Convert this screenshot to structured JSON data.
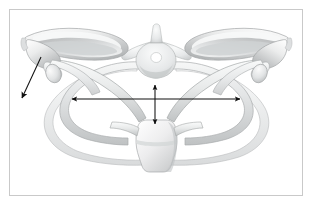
{
  "figure": {
    "domain": "anatomical-illustration",
    "description": "Grayscale medical illustration showing a thoracic vertebra at center, paired ribs forming the thoracic cage, the clavicles, the sternum at the bottom, and the two scapulae at upper left and upper right. Three black measurement arrows are overlaid.",
    "background_color": "#ffffff",
    "frame_border_color": "#c9c9c9",
    "bone_fill_light": "#f4f4f4",
    "bone_fill_mid": "#dedede",
    "bone_fill_dark": "#b4b4b4",
    "bone_outline": "#9a9a9a",
    "annotation_color": "#101010"
  },
  "structures": [
    {
      "id": "left-scapula",
      "name": "Left scapula",
      "label": ""
    },
    {
      "id": "right-scapula",
      "name": "Right scapula",
      "label": ""
    },
    {
      "id": "thoracic-vertebra",
      "name": "Thoracic vertebra",
      "label": ""
    },
    {
      "id": "vertebral-foramen",
      "name": "Vertebral foramen",
      "label": ""
    },
    {
      "id": "left-clavicle",
      "name": "Left clavicle",
      "label": ""
    },
    {
      "id": "right-clavicle",
      "name": "Right clavicle",
      "label": ""
    },
    {
      "id": "left-rib-upper",
      "name": "Left upper rib",
      "label": ""
    },
    {
      "id": "left-rib-lower",
      "name": "Left lower rib",
      "label": ""
    },
    {
      "id": "right-rib-upper",
      "name": "Right upper rib",
      "label": ""
    },
    {
      "id": "right-rib-lower",
      "name": "Right lower rib",
      "label": ""
    },
    {
      "id": "sternum",
      "name": "Sternum",
      "label": ""
    },
    {
      "id": "left-humeral-head",
      "name": "Left humeral head",
      "label": ""
    },
    {
      "id": "right-humeral-head",
      "name": "Right humeral head",
      "label": ""
    }
  ],
  "annotations": {
    "horizontal_arrow": {
      "name": "transverse-width-arrow",
      "label": "",
      "style": "double-headed",
      "x1": 72,
      "y1": 99,
      "x2": 240,
      "y2": 99
    },
    "vertical_arrow": {
      "name": "anteroposterior-depth-arrow",
      "label": "",
      "style": "double-headed",
      "x1": 155,
      "y1": 85,
      "x2": 155,
      "y2": 124
    },
    "diagonal_arrow": {
      "name": "scapular-direction-arrow",
      "label": "",
      "style": "single-headed",
      "x1": 41,
      "y1": 57,
      "x2": 22,
      "y2": 98
    }
  }
}
